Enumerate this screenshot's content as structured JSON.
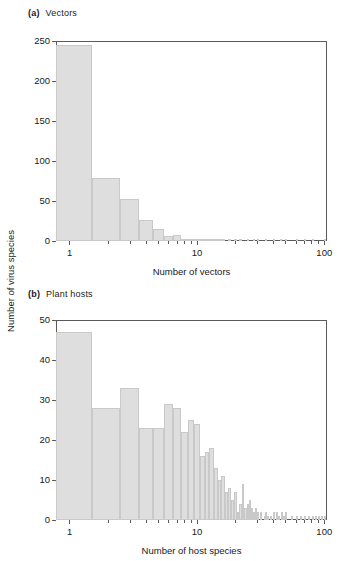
{
  "figure": {
    "shared_ylabel": "Number of virus species"
  },
  "panels": [
    {
      "tag": "(a)",
      "title": "Vectors",
      "xlabel": "Number of vectors",
      "yticks": [
        "0",
        "50",
        "100",
        "150",
        "200",
        "250"
      ],
      "xticks": [
        "1",
        "10",
        "100"
      ]
    },
    {
      "tag": "(b)",
      "title": "Plant hosts",
      "xlabel": "Number of host species",
      "yticks": [
        "0",
        "10",
        "20",
        "30",
        "40",
        "50"
      ],
      "xticks": [
        "1",
        "10",
        "100"
      ]
    }
  ],
  "chart_data": [
    {
      "type": "bar",
      "title": "(a) Vectors",
      "xlabel": "Number of vectors",
      "ylabel": "Number of virus species",
      "xscale": "log",
      "xlim": [
        0.78,
        105
      ],
      "ylim": [
        0,
        250
      ],
      "ytick_values": [
        0,
        50,
        100,
        150,
        200,
        250
      ],
      "xtick_values": [
        1,
        10,
        100
      ],
      "grid": false,
      "legend": "none",
      "x": [
        1,
        2,
        3,
        4,
        5,
        6,
        7,
        8,
        9,
        10,
        11,
        12,
        13,
        14,
        15,
        16,
        18,
        20,
        22,
        25,
        28,
        30,
        35,
        40,
        45,
        50,
        60,
        70,
        80,
        100
      ],
      "values": [
        245,
        79,
        52,
        26,
        15,
        6,
        8,
        1,
        2,
        2,
        1,
        1,
        1,
        1,
        1,
        1,
        1,
        1,
        1,
        1,
        1,
        1,
        1,
        1,
        1,
        1,
        1,
        1,
        1,
        1
      ]
    },
    {
      "type": "bar",
      "title": "(b) Plant hosts",
      "xlabel": "Number of host species",
      "ylabel": "Number of virus species",
      "xscale": "log",
      "xlim": [
        0.78,
        105
      ],
      "ylim": [
        0,
        50
      ],
      "ytick_values": [
        0,
        10,
        20,
        30,
        40,
        50
      ],
      "xtick_values": [
        1,
        10,
        100
      ],
      "grid": false,
      "legend": "none",
      "x": [
        1,
        2,
        3,
        4,
        5,
        6,
        7,
        8,
        9,
        10,
        11,
        12,
        13,
        14,
        15,
        16,
        17,
        18,
        19,
        20,
        21,
        22,
        23,
        24,
        25,
        26,
        27,
        28,
        29,
        30,
        32,
        34,
        35,
        36,
        38,
        40,
        42,
        44,
        46,
        48,
        50,
        55,
        60,
        65,
        70,
        75,
        80,
        85,
        90,
        95,
        100
      ],
      "values": [
        47,
        28,
        33,
        23,
        23,
        29,
        28,
        22,
        25,
        24,
        16,
        17,
        18,
        13,
        10,
        11,
        7,
        8,
        5,
        7,
        2,
        4,
        9,
        3,
        4,
        5,
        3,
        2,
        3,
        2,
        2,
        1,
        2,
        1,
        1,
        2,
        2,
        1,
        2,
        1,
        2,
        1,
        1,
        1,
        1,
        1,
        1,
        1,
        1,
        1,
        1
      ]
    }
  ],
  "colors": {
    "bar_fill": "#dedede",
    "bar_edge": "#c9c9c9",
    "axis": "#5a5a5a",
    "text": "#1a1a1a",
    "background": "#ffffff"
  }
}
